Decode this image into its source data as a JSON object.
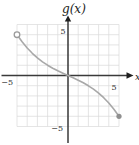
{
  "figure": {
    "title": "g(x)",
    "x_axis_arrow_label": "x",
    "tick_label_strings": {
      "x_neg": "−5",
      "x_pos": "5",
      "y_pos": "5",
      "y_neg": "−5"
    }
  },
  "chart_data": {
    "type": "line",
    "title": "g(x)",
    "xlabel": "x",
    "ylabel": "g(x)",
    "xlim": [
      -5,
      5
    ],
    "ylim": [
      -5,
      5
    ],
    "grid": true,
    "grid_step": 1,
    "x_ticks_labeled": [
      -5,
      5
    ],
    "y_ticks_labeled": [
      5,
      -5
    ],
    "legend": "none",
    "series": [
      {
        "name": "g(x)",
        "description": "decreasing S-shaped curve through the origin, steeper near the ends, shallow at the center",
        "points": [
          [
            -5,
            4
          ],
          [
            -4.5,
            3.3
          ],
          [
            -4,
            2.7
          ],
          [
            -3.5,
            2.18
          ],
          [
            -3,
            1.73
          ],
          [
            -2.5,
            1.34
          ],
          [
            -2,
            1.01
          ],
          [
            -1.5,
            0.72
          ],
          [
            -1,
            0.46
          ],
          [
            -0.5,
            0.23
          ],
          [
            0,
            0
          ],
          [
            0.5,
            -0.23
          ],
          [
            1,
            -0.46
          ],
          [
            1.5,
            -0.72
          ],
          [
            2,
            -1.01
          ],
          [
            2.5,
            -1.34
          ],
          [
            3,
            -1.73
          ],
          [
            3.5,
            -2.18
          ],
          [
            4,
            -2.7
          ],
          [
            4.5,
            -3.3
          ],
          [
            5,
            -4
          ]
        ],
        "left_endpoint": {
          "x": -5,
          "y": 4,
          "style": "open"
        },
        "right_endpoint": {
          "x": 5,
          "y": -4,
          "style": "closed"
        }
      }
    ],
    "colors": {
      "curve": "#a8a8a8",
      "axis": "#3a3a3a",
      "arrow": "#1f1f1f",
      "grid": "#dadada",
      "open_marker_stroke": "#9b9b9b",
      "open_marker_fill": "#ffffff",
      "closed_marker_fill": "#8f8f8f",
      "background": "#ffffff"
    }
  }
}
